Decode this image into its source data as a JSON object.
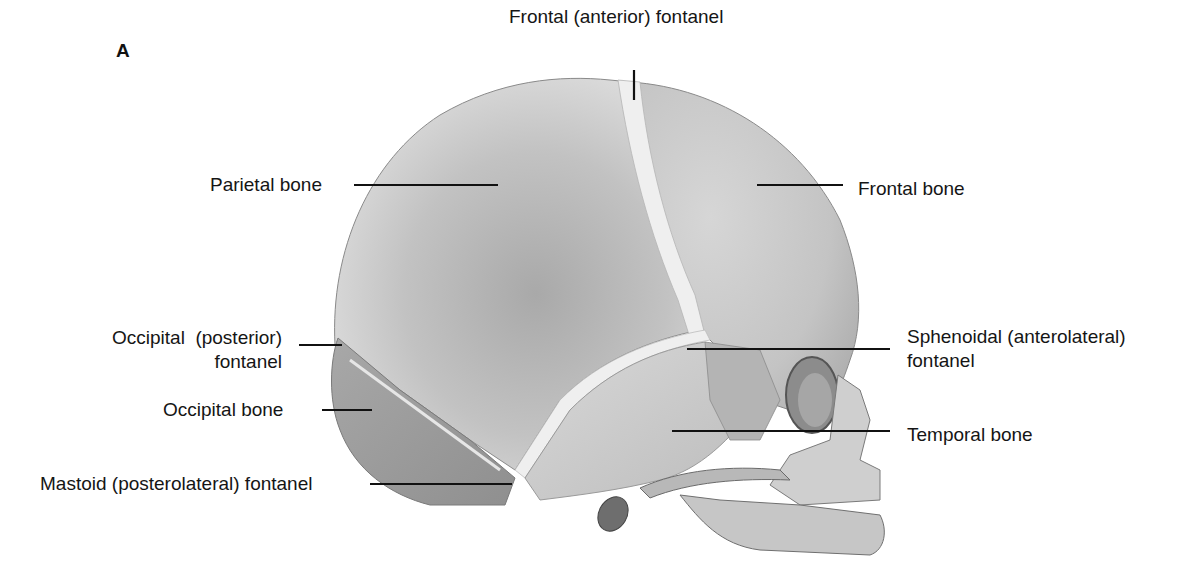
{
  "figure": {
    "panel_letter": "A",
    "colors": {
      "background": "#ffffff",
      "bone_light": "#e4e4e4",
      "bone_mid": "#c8c8c8",
      "bone_dark": "#9a9a9a",
      "fontanel": "#f2f2f2",
      "label_text": "#151515",
      "leader_line": "#111111"
    },
    "labels": [
      {
        "id": "frontal-anterior-fontanel",
        "lines": [
          "Frontal (anterior) fontanel"
        ]
      },
      {
        "id": "parietal-bone",
        "lines": [
          "Parietal bone"
        ]
      },
      {
        "id": "frontal-bone",
        "lines": [
          "Frontal bone"
        ]
      },
      {
        "id": "occipital-posterior-fontanel",
        "lines": [
          "Occipital  (posterior)",
          "fontanel"
        ]
      },
      {
        "id": "sphenoidal-anterolateral-fontanel",
        "lines": [
          "Sphenoidal (anterolateral)",
          "fontanel"
        ]
      },
      {
        "id": "occipital-bone",
        "lines": [
          "Occipital bone"
        ]
      },
      {
        "id": "temporal-bone",
        "lines": [
          "Temporal bone"
        ]
      },
      {
        "id": "mastoid-posterolateral-fontanel",
        "lines": [
          "Mastoid (posterolateral) fontanel"
        ]
      }
    ]
  }
}
